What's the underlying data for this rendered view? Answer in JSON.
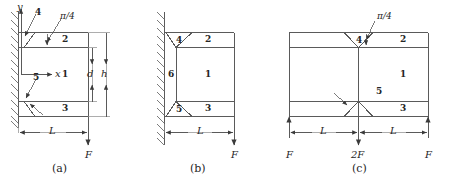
{
  "figure": {
    "type": "engineering-diagram",
    "line_color": "#555555",
    "text_color": "#262626",
    "background": "#ffffff"
  },
  "panels": [
    {
      "caption": "(a)",
      "support": "fixed-wall-left",
      "regions": [
        "1",
        "2",
        "3"
      ],
      "interface_labels": [
        "4",
        "5"
      ],
      "angle_label": "π/4",
      "axes": {
        "x": "x",
        "y": "y"
      },
      "dimensions": [
        {
          "label": "L",
          "orientation": "horizontal"
        },
        {
          "label": "d",
          "orientation": "vertical"
        },
        {
          "label": "h",
          "orientation": "vertical"
        }
      ],
      "loads": [
        {
          "label": "F",
          "direction": "down"
        }
      ]
    },
    {
      "caption": "(b)",
      "support": "fixed-wall-left",
      "regions": [
        "1",
        "2",
        "3",
        "6"
      ],
      "interface_labels": [
        "4",
        "5"
      ],
      "angle_label": "",
      "dimensions": [
        {
          "label": "L",
          "orientation": "horizontal"
        }
      ],
      "loads": [
        {
          "label": "F",
          "direction": "down"
        }
      ]
    },
    {
      "caption": "(c)",
      "support": "none-symmetric",
      "regions": [
        "1",
        "2",
        "3"
      ],
      "interface_labels": [
        "4",
        "5"
      ],
      "angle_label": "π/4",
      "dimensions": [
        {
          "label": "L",
          "orientation": "horizontal"
        },
        {
          "label": "L",
          "orientation": "horizontal"
        }
      ],
      "loads": [
        {
          "label": "F",
          "direction": "up"
        },
        {
          "label": "2F",
          "direction": "down"
        },
        {
          "label": "F",
          "direction": "up"
        }
      ]
    }
  ],
  "labels": {
    "a": {
      "axis_y": "y",
      "axis_x": "x",
      "n4": "4",
      "n5": "5",
      "n1": "1",
      "n2": "2",
      "n3": "3",
      "angle_num": "π",
      "angle_den": "4",
      "angle": "π/4",
      "dim_L": "L",
      "dim_d": "d",
      "dim_h": "h",
      "load_F": "F",
      "caption": "(a)"
    },
    "b": {
      "n4": "4",
      "n5": "5",
      "n6": "6",
      "n1": "1",
      "n2": "2",
      "n3": "3",
      "dim_L": "L",
      "load_F": "F",
      "caption": "(b)"
    },
    "c": {
      "n4": "4",
      "n5": "5",
      "n1": "1",
      "n2": "2",
      "n3": "3",
      "angle": "π/4",
      "dim_L_left": "L",
      "dim_L_right": "L",
      "load_F_left": "F",
      "load_2F": "2F",
      "load_F_right": "F",
      "caption": "(c)"
    }
  }
}
